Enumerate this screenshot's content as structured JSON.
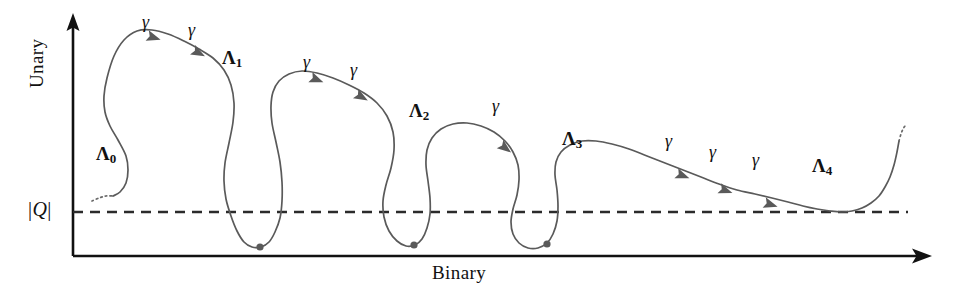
{
  "figure": {
    "background_color": "#ffffff",
    "curve_color": "#5a5a5a",
    "axis_color": "#111111",
    "threshold_color": "#2b2b2b"
  },
  "axes": {
    "y_label": "Unary",
    "x_label": "Binary",
    "threshold_label_q": "Q",
    "threshold_bar_left": "|",
    "threshold_bar_right": "|",
    "y_axis_x": 73,
    "x_axis_y": 256,
    "x_axis_end": 930,
    "y_axis_top": 18,
    "threshold_y": 212
  },
  "critical_points": [
    {
      "id": "lambda-0",
      "label": "Λ",
      "subscript": "0",
      "label_x": 96,
      "label_y": 143
    },
    {
      "id": "lambda-1",
      "label": "Λ",
      "subscript": "1",
      "label_x": 222,
      "label_y": 47
    },
    {
      "id": "lambda-2",
      "label": "Λ",
      "subscript": "2",
      "label_x": 409,
      "label_y": 100
    },
    {
      "id": "lambda-3",
      "label": "Λ",
      "subscript": "3",
      "label_x": 562,
      "label_y": 128
    },
    {
      "id": "lambda-4",
      "label": "Λ",
      "subscript": "4",
      "label_x": 812,
      "label_y": 155
    }
  ],
  "flow_arrows": [
    {
      "id": "gamma-1",
      "label": "γ",
      "label_x": 142,
      "label_y": 12
    },
    {
      "id": "gamma-2",
      "label": "γ",
      "label_x": 188,
      "label_y": 20
    },
    {
      "id": "gamma-3",
      "label": "γ",
      "label_x": 303,
      "label_y": 52
    },
    {
      "id": "gamma-4",
      "label": "γ",
      "label_x": 350,
      "label_y": 60
    },
    {
      "id": "gamma-5",
      "label": "γ",
      "label_x": 492,
      "label_y": 96
    },
    {
      "id": "gamma-6",
      "label": "γ",
      "label_x": 665,
      "label_y": 131
    },
    {
      "id": "gamma-7",
      "label": "γ",
      "label_x": 709,
      "label_y": 142
    },
    {
      "id": "gamma-8",
      "label": "γ",
      "label_x": 752,
      "label_y": 150
    }
  ],
  "chart_data": {
    "type": "line",
    "title": "",
    "xlabel": "Binary",
    "ylabel": "Unary",
    "grid": false,
    "legend": false,
    "threshold": {
      "label": "|Q|",
      "y_pixel": 212,
      "style": "dashed"
    },
    "axis_ranges": {
      "x_pixels": [
        73,
        930
      ],
      "y_pixels": [
        256,
        18
      ]
    },
    "curve_segments": [
      {
        "name": "lambda-0-dotted-tail",
        "style": "dotted",
        "points": [
          [
            92,
            201
          ],
          [
            99,
            198
          ],
          [
            106,
            196
          ],
          [
            113,
            196
          ]
        ]
      },
      {
        "name": "main-flow-curve",
        "style": "solid",
        "points": [
          [
            113,
            196
          ],
          [
            120,
            192
          ],
          [
            126,
            183
          ],
          [
            128,
            170
          ],
          [
            126,
            156
          ],
          [
            118,
            140
          ],
          [
            110,
            126
          ],
          [
            105,
            112
          ],
          [
            104,
            96
          ],
          [
            107,
            78
          ],
          [
            114,
            56
          ],
          [
            124,
            40
          ],
          [
            137,
            31
          ],
          [
            152,
            30
          ],
          [
            168,
            34
          ],
          [
            184,
            41
          ],
          [
            199,
            49
          ],
          [
            213,
            58
          ],
          [
            224,
            70
          ],
          [
            231,
            85
          ],
          [
            234,
            103
          ],
          [
            233,
            122
          ],
          [
            229,
            143
          ],
          [
            225,
            163
          ],
          [
            224,
            181
          ],
          [
            226,
            199
          ],
          [
            231,
            216
          ],
          [
            237,
            231
          ],
          [
            244,
            242
          ],
          [
            252,
            247
          ],
          [
            261,
            247
          ],
          [
            269,
            242
          ],
          [
            275,
            232
          ],
          [
            280,
            218
          ],
          [
            282,
            201
          ],
          [
            282,
            182
          ],
          [
            280,
            162
          ],
          [
            276,
            142
          ],
          [
            272,
            123
          ],
          [
            271,
            106
          ],
          [
            273,
            92
          ],
          [
            279,
            81
          ],
          [
            289,
            74
          ],
          [
            302,
            71
          ],
          [
            317,
            73
          ],
          [
            333,
            78
          ],
          [
            349,
            85
          ],
          [
            364,
            93
          ],
          [
            377,
            103
          ],
          [
            387,
            116
          ],
          [
            393,
            132
          ],
          [
            394,
            150
          ],
          [
            391,
            168
          ],
          [
            386,
            185
          ],
          [
            383,
            201
          ],
          [
            384,
            217
          ],
          [
            389,
            231
          ],
          [
            397,
            241
          ],
          [
            406,
            246
          ],
          [
            415,
            245
          ],
          [
            422,
            239
          ],
          [
            427,
            228
          ],
          [
            430,
            214
          ],
          [
            430,
            198
          ],
          [
            428,
            181
          ],
          [
            426,
            165
          ],
          [
            427,
            150
          ],
          [
            432,
            138
          ],
          [
            441,
            129
          ],
          [
            453,
            124
          ],
          [
            467,
            123
          ],
          [
            481,
            126
          ],
          [
            494,
            132
          ],
          [
            505,
            141
          ],
          [
            513,
            152
          ],
          [
            518,
            165
          ],
          [
            519,
            180
          ],
          [
            517,
            195
          ],
          [
            513,
            209
          ],
          [
            511,
            222
          ],
          [
            513,
            234
          ],
          [
            519,
            243
          ],
          [
            528,
            248
          ],
          [
            538,
            248
          ],
          [
            547,
            243
          ],
          [
            553,
            234
          ],
          [
            557,
            221
          ],
          [
            558,
            206
          ],
          [
            557,
            190
          ],
          [
            555,
            175
          ],
          [
            556,
            162
          ],
          [
            561,
            152
          ],
          [
            570,
            145
          ],
          [
            582,
            141
          ],
          [
            596,
            141
          ],
          [
            612,
            144
          ],
          [
            629,
            149
          ],
          [
            647,
            156
          ],
          [
            665,
            163
          ],
          [
            683,
            170
          ],
          [
            701,
            177
          ],
          [
            719,
            184
          ],
          [
            737,
            190
          ],
          [
            755,
            194
          ],
          [
            772,
            198
          ],
          [
            788,
            202
          ],
          [
            803,
            206
          ],
          [
            817,
            209
          ],
          [
            830,
            211
          ],
          [
            841,
            212
          ],
          [
            852,
            211
          ],
          [
            862,
            208
          ],
          [
            871,
            203
          ],
          [
            879,
            196
          ],
          [
            885,
            187
          ],
          [
            890,
            177
          ],
          [
            894,
            165
          ],
          [
            897,
            152
          ],
          [
            899,
            141
          ]
        ]
      },
      {
        "name": "lambda-4-dotted-tail",
        "style": "dotted",
        "points": [
          [
            899,
            141
          ],
          [
            901,
            134
          ],
          [
            903,
            129
          ],
          [
            905,
            126
          ]
        ]
      }
    ],
    "critical_dots": [
      {
        "name": "lambda-1-minimum",
        "x": 260,
        "y": 247
      },
      {
        "name": "lambda-2-minimum",
        "x": 414,
        "y": 245
      },
      {
        "name": "lambda-3-minimum",
        "x": 547,
        "y": 244
      }
    ],
    "arrow_markers": [
      {
        "name": "gamma-1-arrow",
        "x": 152,
        "y": 37,
        "angle": 17
      },
      {
        "name": "gamma-2-arrow",
        "x": 197,
        "y": 52,
        "angle": 28
      },
      {
        "name": "gamma-3-arrow",
        "x": 315,
        "y": 79,
        "angle": 22
      },
      {
        "name": "gamma-4-arrow",
        "x": 360,
        "y": 96,
        "angle": 30
      },
      {
        "name": "gamma-5-arrow",
        "x": 504,
        "y": 147,
        "angle": 38
      },
      {
        "name": "gamma-6-arrow",
        "x": 681,
        "y": 175,
        "angle": 21
      },
      {
        "name": "gamma-7-arrow",
        "x": 724,
        "y": 190,
        "angle": 20
      },
      {
        "name": "gamma-8-arrow",
        "x": 769,
        "y": 204,
        "angle": 17
      }
    ]
  }
}
